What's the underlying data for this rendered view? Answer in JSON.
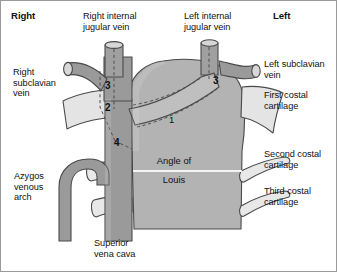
{
  "diagram": {
    "type": "anatomical-illustration",
    "background_color": "#ffffff",
    "palette": {
      "vein_fill": "#9a9a9a",
      "body_fill": "#b3b3b3",
      "cartilage_fill": "#e4e4e4",
      "outline": "#4a4a4a",
      "dashed_line": "#555555",
      "text": "#111111"
    }
  },
  "side_headings": {
    "right": "Right",
    "left": "Left"
  },
  "labels": {
    "right_internal_jugular_vein": "Right internal\njugular vein",
    "left_internal_jugular_vein": "Left internal\njugular vein",
    "right_subclavian_vein": "Right\nsubclavian\nvein",
    "left_subclavian_vein": "Left subclavian\nvein",
    "first_costal_cartilage": "First costal\ncartilage",
    "second_costal_cartilage": "Second costal\ncartilage",
    "third_costal_cartilage": "Third costal\ncartilage",
    "azygos_venous_arch": "Azygos\nvenous\narch",
    "superior_vena_cava": "Superior\nvena cava"
  },
  "sternal_angle": {
    "line1": "Angle of",
    "line2": "Louis"
  },
  "numbered_markers": [
    {
      "id": "num-3-right",
      "text": "3",
      "side": "right"
    },
    {
      "id": "num-2",
      "text": "2",
      "side": "right"
    },
    {
      "id": "num-4",
      "text": "4",
      "side": "right"
    },
    {
      "id": "num-1",
      "text": "1",
      "side": "centre"
    },
    {
      "id": "num-3-left",
      "text": "3",
      "side": "left"
    }
  ]
}
